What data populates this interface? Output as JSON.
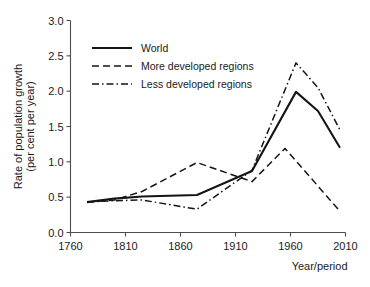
{
  "chart_data": {
    "type": "line",
    "title": "",
    "subtitle": "",
    "xlabel": "Year/period",
    "ylabel": "Rate of population growth\n(per cent per year)",
    "ylabel_line1": "Rate of population growth",
    "ylabel_line2": "(per cent per year)",
    "xlim": [
      1760,
      2010
    ],
    "ylim": [
      0.0,
      3.0
    ],
    "xticks": [
      1760,
      1810,
      1860,
      1910,
      1960,
      2010
    ],
    "xticklabels": [
      "1760",
      "1810",
      "1860",
      "1910",
      "1960",
      "2010"
    ],
    "yticks": [
      0.0,
      0.5,
      1.0,
      1.5,
      2.0,
      2.5,
      3.0
    ],
    "yticklabels": [
      "0.0",
      "0.5",
      "1.0",
      "1.5",
      "2.0",
      "2.5",
      "3.0"
    ],
    "grid": false,
    "legend_position": "upper left",
    "line_color": "#151515",
    "series": [
      {
        "name": "World",
        "style": "solid",
        "x": [
          1775,
          1800,
          1825,
          1875,
          1925,
          1965,
          1985,
          2005
        ],
        "values": [
          0.43,
          0.48,
          0.51,
          0.53,
          0.87,
          1.99,
          1.72,
          1.2
        ]
      },
      {
        "name": "More developed regions",
        "style": "dashed",
        "x": [
          1775,
          1800,
          1825,
          1875,
          1925,
          1955,
          2005
        ],
        "values": [
          0.43,
          0.46,
          0.58,
          0.99,
          0.72,
          1.19,
          0.3
        ]
      },
      {
        "name": "Less developed regions",
        "style": "dashdot",
        "x": [
          1775,
          1800,
          1825,
          1875,
          1925,
          1965,
          1985,
          2005
        ],
        "values": [
          0.43,
          0.45,
          0.46,
          0.33,
          0.88,
          2.4,
          2.05,
          1.45
        ]
      }
    ]
  },
  "legend": {
    "items": [
      {
        "label": "World"
      },
      {
        "label": "More developed regions"
      },
      {
        "label": "Less developed regions"
      }
    ]
  }
}
